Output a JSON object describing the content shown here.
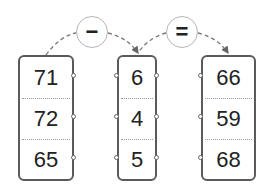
{
  "operators": [
    {
      "symbol": "−",
      "name": "minus"
    },
    {
      "symbol": "=",
      "name": "equals"
    }
  ],
  "columns": [
    {
      "name": "minuend",
      "values": [
        "71",
        "72",
        "65"
      ]
    },
    {
      "name": "subtrahend",
      "values": [
        "6",
        "4",
        "5"
      ]
    },
    {
      "name": "difference",
      "values": [
        "66",
        "59",
        "68"
      ]
    }
  ],
  "colors": {
    "box_border": "#5a5a5a",
    "circle_border": "#b5b5b5",
    "arrow": "#666666",
    "text": "#222222"
  }
}
